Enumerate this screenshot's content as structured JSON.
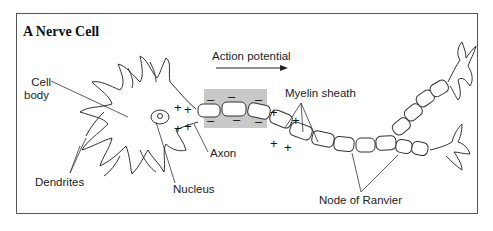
{
  "figure": {
    "title": "A Nerve Cell",
    "labels": {
      "cell_body_line1": "Cell",
      "cell_body_line2": "body",
      "action_potential": "Action potential",
      "myelin_sheath": "Myelin sheath",
      "axon": "Axon",
      "dendrites": "Dendrites",
      "nucleus": "Nucleus",
      "node_of_ranvier": "Node of Ranvier"
    },
    "charges": {
      "positive": "+",
      "negative": "–"
    },
    "colors": {
      "line": "#333333",
      "depolarized_region": "#c8c8c8",
      "frame": "#555555"
    }
  }
}
